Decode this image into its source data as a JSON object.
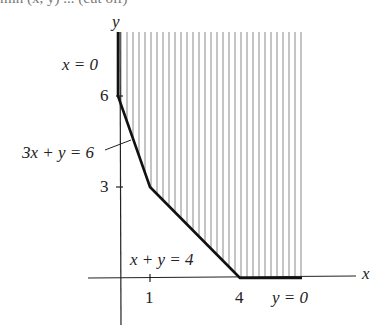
{
  "header": {
    "cut_off_text": "min (x, y) ... (cut off)"
  },
  "axes": {
    "x_label": "x",
    "y_label": "y",
    "x_ticks": [
      "1",
      "4"
    ],
    "y_ticks": [
      "6",
      "3"
    ]
  },
  "constraints": {
    "x_zero": "x = 0",
    "three_x_plus_y": "3x + y = 6",
    "x_plus_y": "x + y = 4",
    "y_zero": "y = 0"
  },
  "region": {
    "description": "Feasible region (hatched) bounded below by x = 0, 3x + y = 6, x + y = 4, y = 0",
    "vertices": [
      [
        0,
        6
      ],
      [
        1,
        3
      ],
      [
        4,
        0
      ]
    ],
    "hatch_color": "#8a8a8a",
    "boundary_color": "#111111"
  }
}
